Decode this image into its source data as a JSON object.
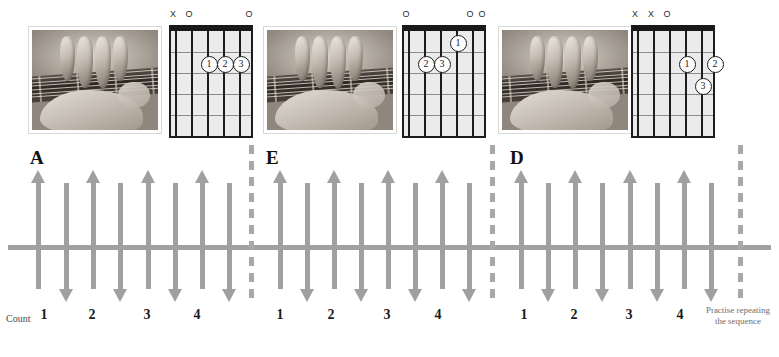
{
  "chords": [
    {
      "name": "A",
      "panel_left": 28,
      "grid_left": 168,
      "photo_alt": "hand-fingering-a-chord",
      "markers": [
        "X",
        "O",
        "",
        "",
        "",
        "O"
      ],
      "fingers": [
        {
          "label": "1",
          "string": 4,
          "fret": 2
        },
        {
          "label": "2",
          "string": 3,
          "fret": 2
        },
        {
          "label": "3",
          "string": 2,
          "fret": 2
        }
      ]
    },
    {
      "name": "E",
      "panel_left": 263,
      "grid_left": 401,
      "photo_alt": "hand-fingering-e-chord",
      "markers": [
        "O",
        "",
        "",
        "",
        "O",
        "O"
      ],
      "fingers": [
        {
          "label": "1",
          "string": 3,
          "fret": 1
        },
        {
          "label": "2",
          "string": 5,
          "fret": 2
        },
        {
          "label": "3",
          "string": 4,
          "fret": 2
        }
      ]
    },
    {
      "name": "D",
      "panel_left": 498,
      "grid_left": 630,
      "photo_alt": "hand-fingering-d-chord",
      "markers": [
        "X",
        "X",
        "O",
        "",
        "",
        ""
      ],
      "fingers": [
        {
          "label": "1",
          "string": 3,
          "fret": 2
        },
        {
          "label": "2",
          "string": 1,
          "fret": 2
        },
        {
          "label": "3",
          "string": 2,
          "fret": 3
        }
      ]
    }
  ],
  "strum": {
    "count_word": "Count",
    "practise_note": "Practise repeating the sequence",
    "measures": [
      {
        "chord": "A",
        "label_x": 30,
        "counts": [
          {
            "label": "1",
            "x": 44
          },
          {
            "label": "2",
            "x": 92
          },
          {
            "label": "3",
            "x": 147
          },
          {
            "label": "4",
            "x": 197
          }
        ],
        "arrows": [
          {
            "dir": "up",
            "x": 38
          },
          {
            "dir": "down",
            "x": 66
          },
          {
            "dir": "up",
            "x": 93
          },
          {
            "dir": "down",
            "x": 120
          },
          {
            "dir": "up",
            "x": 148
          },
          {
            "dir": "down",
            "x": 175
          },
          {
            "dir": "up",
            "x": 202
          },
          {
            "dir": "down",
            "x": 229
          }
        ]
      },
      {
        "chord": "E",
        "label_x": 266,
        "counts": [
          {
            "label": "1",
            "x": 280
          },
          {
            "label": "2",
            "x": 331
          },
          {
            "label": "3",
            "x": 387
          },
          {
            "label": "4",
            "x": 438
          }
        ],
        "arrows": [
          {
            "dir": "up",
            "x": 280
          },
          {
            "dir": "down",
            "x": 307
          },
          {
            "dir": "up",
            "x": 334
          },
          {
            "dir": "down",
            "x": 361
          },
          {
            "dir": "up",
            "x": 388
          },
          {
            "dir": "down",
            "x": 415
          },
          {
            "dir": "up",
            "x": 442
          },
          {
            "dir": "down",
            "x": 469
          }
        ]
      },
      {
        "chord": "D",
        "label_x": 510,
        "counts": [
          {
            "label": "1",
            "x": 524
          },
          {
            "label": "2",
            "x": 574
          },
          {
            "label": "3",
            "x": 629
          },
          {
            "label": "4",
            "x": 680
          }
        ],
        "arrows": [
          {
            "dir": "up",
            "x": 521
          },
          {
            "dir": "down",
            "x": 548
          },
          {
            "dir": "up",
            "x": 575
          },
          {
            "dir": "down",
            "x": 602
          },
          {
            "dir": "up",
            "x": 630
          },
          {
            "dir": "down",
            "x": 657
          },
          {
            "dir": "up",
            "x": 684
          },
          {
            "dir": "down",
            "x": 711
          }
        ]
      }
    ],
    "barlines": [
      {
        "x": 249
      },
      {
        "x": 490
      },
      {
        "x": 738
      }
    ]
  },
  "colors": {
    "arrow_gray": "#a0a0a0",
    "barline_gray": "#a8a8a8",
    "grid_black": "#1d1d1d",
    "fretboard_fill": "#ebebeb",
    "label_black": "#111111",
    "note_gray": "#6d6d6d"
  }
}
